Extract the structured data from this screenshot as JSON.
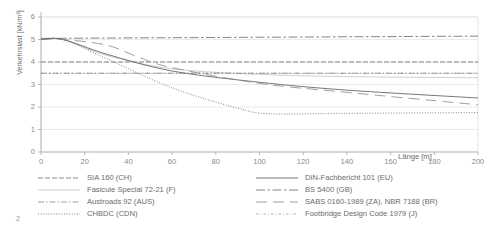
{
  "page_number": "2",
  "chart_data": {
    "type": "line",
    "title": "",
    "xlabel": "Länge [m]",
    "ylabel": "Verkehrslast [kN/m²]",
    "xlim": [
      0,
      200
    ],
    "ylim": [
      0,
      6
    ],
    "xticks": [
      0,
      20,
      40,
      60,
      80,
      100,
      120,
      140,
      160,
      180,
      200
    ],
    "yticks": [
      0,
      1,
      2,
      3,
      4,
      5,
      6
    ],
    "grid": true,
    "legend_position": "below",
    "series": [
      {
        "name": "SIA 160 (CH)",
        "dash": "dashed-fine",
        "color": "#555555",
        "x": [
          0,
          200
        ],
        "values": [
          4.0,
          4.0
        ]
      },
      {
        "name": "Fasicule Special 72-21 (F)",
        "dash": "solid-light",
        "color": "#c8c8c8",
        "x": [
          0,
          10,
          30,
          60,
          100,
          140,
          200
        ],
        "values": [
          5.0,
          5.0,
          4.3,
          3.7,
          3.45,
          3.35,
          3.3
        ]
      },
      {
        "name": "Austroads 92 (AUS)",
        "dash": "dash-dot",
        "color": "#777777",
        "x": [
          0,
          200
        ],
        "values": [
          3.5,
          3.5
        ]
      },
      {
        "name": "CHBDC (CDN)",
        "dash": "dotted",
        "color": "#666666",
        "x": [
          0,
          10,
          30,
          60,
          90,
          105,
          140,
          200
        ],
        "values": [
          5.0,
          5.0,
          4.15,
          2.85,
          1.95,
          1.7,
          1.72,
          1.75
        ]
      },
      {
        "name": "DIN-Fachbericht 101 (EU)",
        "dash": "solid",
        "color": "#555555",
        "x": [
          0,
          10,
          30,
          60,
          100,
          140,
          200
        ],
        "values": [
          5.0,
          5.0,
          4.35,
          3.6,
          3.1,
          2.75,
          2.4
        ]
      },
      {
        "name": "BS 5400 (GB)",
        "dash": "dash-dot-long",
        "color": "#666666",
        "x": [
          0,
          200
        ],
        "values": [
          5.05,
          5.15
        ]
      },
      {
        "name": "SABS 0160-1989 (ZA), NBR 7188 (BR)",
        "dash": "long-dash",
        "color": "#888888",
        "x": [
          0,
          10,
          30,
          45,
          60,
          100,
          140,
          200
        ],
        "values": [
          5.0,
          5.0,
          4.75,
          4.2,
          3.75,
          3.05,
          2.65,
          2.1
        ]
      },
      {
        "name": "Footbridge Design Code 1979 (J)",
        "dash": "fine-dash-dot",
        "color": "#8a8a8a",
        "x": [
          0,
          200
        ],
        "values": [
          3.5,
          3.5
        ]
      }
    ]
  }
}
